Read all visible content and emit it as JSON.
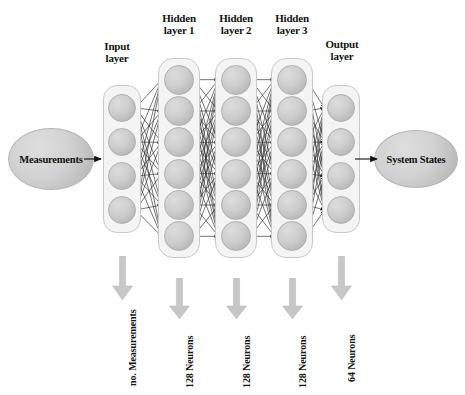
{
  "diagram": {
    "background_color": "#ffffff",
    "node_color": "#cfcfcf",
    "box_color": "#f4f4f4",
    "arrow_color": "#c0c0c0",
    "edge_color": "#2b2b2b"
  },
  "input_block": {
    "label": "Measurements"
  },
  "output_block": {
    "label": "System States"
  },
  "layers": [
    {
      "id": "input-layer",
      "label": "Input\nlayer",
      "neurons": 4,
      "annotation": "no. Measurements"
    },
    {
      "id": "hidden-layer-1",
      "label": "Hidden\nlayer 1",
      "neurons": 6,
      "annotation": "128 Neurons"
    },
    {
      "id": "hidden-layer-2",
      "label": "Hidden\nlayer 2",
      "neurons": 6,
      "annotation": "128 Neurons"
    },
    {
      "id": "hidden-layer-3",
      "label": "Hidden\nlayer 3",
      "neurons": 6,
      "annotation": "128 Neurons"
    },
    {
      "id": "output-layer",
      "label": "Output\nlayer",
      "neurons": 4,
      "annotation": "64 Neurons"
    }
  ],
  "icons": {
    "input_arrow": "arrow-right-icon",
    "output_arrow": "arrow-right-icon",
    "down_arrow": "arrow-down-icon"
  }
}
